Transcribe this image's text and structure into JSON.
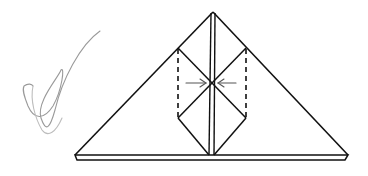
{
  "diagram": {
    "type": "origami-fold-diagram",
    "colors": {
      "background": "#ffffff",
      "line": "#111111",
      "arrow": "#555555",
      "scribble": "#8a8a8a"
    },
    "elements": [
      {
        "id": "outer-triangle",
        "kind": "solid-line"
      },
      {
        "id": "base-strip",
        "kind": "solid-line"
      },
      {
        "id": "center-spine",
        "kind": "double-line"
      },
      {
        "id": "inner-folds",
        "kind": "solid-line"
      },
      {
        "id": "left-dashed-fold",
        "kind": "dashed-line"
      },
      {
        "id": "right-dashed-fold",
        "kind": "dashed-line"
      },
      {
        "id": "left-arrow",
        "kind": "arrow",
        "direction": "right"
      },
      {
        "id": "right-arrow",
        "kind": "arrow",
        "direction": "left"
      },
      {
        "id": "pen-scribble",
        "kind": "freehand"
      }
    ]
  }
}
